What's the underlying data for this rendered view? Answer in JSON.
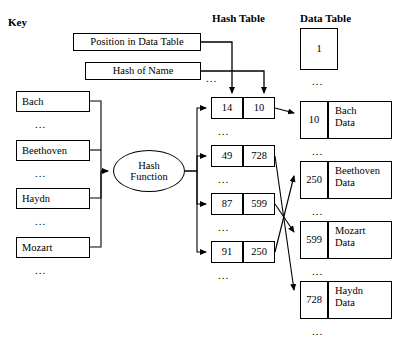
{
  "labels": {
    "key": "Key",
    "hash_table": "Hash Table",
    "data_table": "Data Table"
  },
  "callouts": {
    "position": "Position in Data Table",
    "hash_of_name": "Hash of Name"
  },
  "hash_function": {
    "line1": "Hash",
    "line2": "Function"
  },
  "ellipsis": "...",
  "key_column": {
    "items": [
      {
        "name": "Bach"
      },
      {
        "name": "Beethoven"
      },
      {
        "name": "Haydn"
      },
      {
        "name": "Mozart"
      }
    ]
  },
  "hash_table": {
    "rows": [
      {
        "index": "14",
        "value": "10"
      },
      {
        "index": "49",
        "value": "728"
      },
      {
        "index": "87",
        "value": "599"
      },
      {
        "index": "91",
        "value": "250"
      }
    ]
  },
  "data_table": {
    "top_cell": "1",
    "rows": [
      {
        "index": "10",
        "line1": "Bach",
        "line2": "Data"
      },
      {
        "index": "250",
        "line1": "Beethoven",
        "line2": "Data"
      },
      {
        "index": "599",
        "line1": "Mozart",
        "line2": "Data"
      },
      {
        "index": "728",
        "line1": "Haydn",
        "line2": "Data"
      }
    ]
  }
}
